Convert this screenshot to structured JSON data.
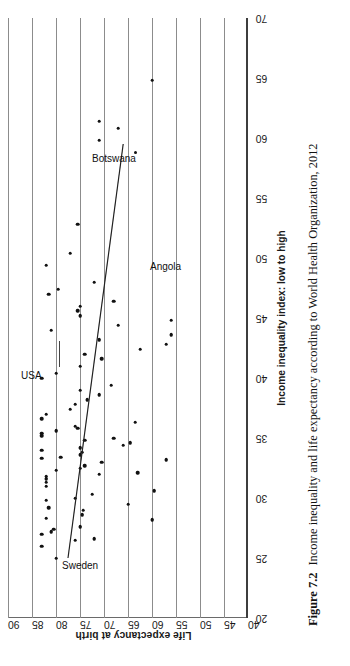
{
  "figure": {
    "number": "Figure 7.2",
    "caption": "Income inequality and life expectancy according to World Health Organization, 2012"
  },
  "axes": {
    "x_label": "Income inequality index: low to high",
    "y_label": "Life expectancy at birth",
    "x_ticks": [
      "20",
      "25",
      "30",
      "35",
      "40",
      "45",
      "50",
      "55",
      "60",
      "65",
      "70"
    ],
    "y_ticks": [
      "40",
      "45",
      "50",
      "55",
      "60",
      "65",
      "70",
      "75",
      "80",
      "85",
      "90"
    ]
  },
  "annotations": [
    {
      "name": "sweden",
      "label": "Sweden"
    },
    {
      "name": "usa",
      "label": "USA"
    },
    {
      "name": "botswana",
      "label": "Botswana"
    },
    {
      "name": "angola",
      "label": "Angola"
    }
  ],
  "chart_data": {
    "type": "scatter",
    "title": "Income inequality and life expectancy according to World Health Organization, 2012",
    "xlabel": "Income inequality index: low to high",
    "ylabel": "Life expectancy at birth",
    "xlim": [
      20,
      70
    ],
    "ylim": [
      40,
      90
    ],
    "xticks": [
      20,
      25,
      30,
      35,
      40,
      45,
      50,
      55,
      60,
      65,
      70
    ],
    "yticks": [
      40,
      45,
      50,
      55,
      60,
      65,
      70,
      75,
      80,
      85,
      90
    ],
    "grid": "horizontal",
    "legend": "none",
    "point_color": "#111111",
    "x": [
      25.0,
      26.0,
      26.5,
      26.6,
      27.0,
      27.2,
      27.4,
      27.6,
      28.2,
      28.3,
      28.6,
      29.0,
      29.2,
      29.5,
      29.8,
      30.0,
      30.3,
      30.6,
      31.0,
      31.3,
      31.6,
      31.8,
      32.0,
      32.1,
      32.3,
      32.5,
      32.7,
      33.0,
      33.2,
      33.3,
      33.4,
      33.6,
      33.8,
      34.0,
      34.2,
      34.4,
      34.6,
      34.8,
      35.0,
      35.2,
      35.4,
      35.6,
      35.8,
      36.0,
      36.3,
      36.6,
      37.0,
      37.4,
      37.8,
      38.2,
      38.6,
      39.0,
      39.4,
      40.0,
      40.4,
      41.0,
      41.6,
      42.0,
      42.4,
      42.8,
      43.2,
      43.6,
      44.0,
      44.4,
      44.8,
      45.2,
      45.6,
      46.0,
      46.4,
      47.0,
      47.4,
      48.0,
      49.4,
      50.4,
      52.8,
      59.8,
      60.8,
      61.4,
      64.8
    ],
    "y": [
      80.0,
      83.0,
      76.0,
      72.0,
      83.0,
      81.0,
      80.5,
      75.0,
      60.0,
      82.0,
      74.5,
      74.3,
      81.5,
      65.0,
      82.0,
      76.0,
      72.5,
      59.5,
      82.0,
      82.0,
      82.0,
      82.0,
      71.0,
      63.0,
      80.0,
      75.0,
      74.0,
      70.5,
      57.0,
      83.0,
      79.0,
      75.0,
      74.5,
      83.0,
      75.0,
      66.0,
      64.5,
      74.0,
      68.0,
      83.0,
      83.0,
      80.0,
      75.5,
      76.0,
      63.5,
      83.0,
      82.0,
      77.0,
      76.0,
      73.5,
      71.0,
      75.0,
      68.5,
      83.0,
      80.0,
      75.0,
      70.5,
      74.0,
      62.5,
      57.0,
      71.0,
      56.0,
      81.0,
      67.0,
      56.0,
      75.0,
      75.5,
      75.0,
      68.0,
      81.5,
      79.5,
      72.0,
      82.0,
      77.0,
      75.5,
      71.0,
      67.0,
      71.0,
      60.0
    ],
    "highlighted_points": [
      {
        "label": "Sweden",
        "x": 25.0,
        "y": 80.0
      },
      {
        "label": "USA",
        "x": 41.0,
        "y": 79.0
      },
      {
        "label": "Botswana",
        "x": 58.0,
        "y": 63.0
      },
      {
        "label": "Angola",
        "x": 49.0,
        "y": 52.0
      }
    ],
    "trend_line": {
      "x": [
        25.0,
        59.5
      ],
      "y": [
        77.5,
        66.0
      ],
      "note": "fitted negative-slope regression line"
    }
  }
}
